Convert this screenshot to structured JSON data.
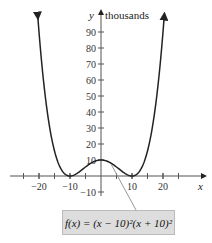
{
  "chart_data": {
    "type": "line",
    "title": "",
    "function": "f(x) = (x − 10)^2 (x + 10)^2",
    "xlabel": "x",
    "ylabel": "y",
    "y_unit": "thousands",
    "xlim": [
      -27,
      30
    ],
    "ylim": [
      -18,
      100
    ],
    "x_ticks": [
      -20,
      -10,
      10,
      20
    ],
    "y_ticks": [
      -10,
      10,
      20,
      30,
      40,
      50,
      60,
      70,
      80,
      90
    ],
    "series": [
      {
        "name": "f(x)",
        "x": [
          -20,
          -15,
          -10,
          -5,
          0,
          5,
          10,
          15,
          20
        ],
        "values": [
          90,
          15.6,
          0,
          5.6,
          10,
          5.6,
          0,
          15.6,
          90
        ]
      }
    ],
    "annotation": "f(x) = (x − 10)²(x + 10)²",
    "grid": false,
    "legend": "none"
  },
  "labels": {
    "y_axis": "y",
    "y_unit": "thousands",
    "x_axis": "x",
    "x_ticks": [
      "−20",
      "−10",
      "10",
      "20"
    ],
    "y_ticks": [
      "90",
      "80",
      "70",
      "60",
      "50",
      "40",
      "30",
      "20",
      "10",
      "−10"
    ],
    "formula": "f(x) = (x − 10)²(x + 10)²"
  }
}
